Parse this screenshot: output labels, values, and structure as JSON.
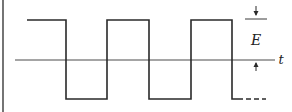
{
  "diagram": {
    "type": "square-wave",
    "labels": {
      "amplitude": "E",
      "time_axis": "t"
    },
    "colors": {
      "line": "#2a2a2a",
      "axis": "#4a4a4a",
      "background": "#ffffff"
    },
    "levels": {
      "high_y": 20,
      "axis_y": 60,
      "low_y": 99
    },
    "edges_x": [
      27,
      66,
      107,
      149,
      191,
      232
    ],
    "continuation": "dashed"
  }
}
